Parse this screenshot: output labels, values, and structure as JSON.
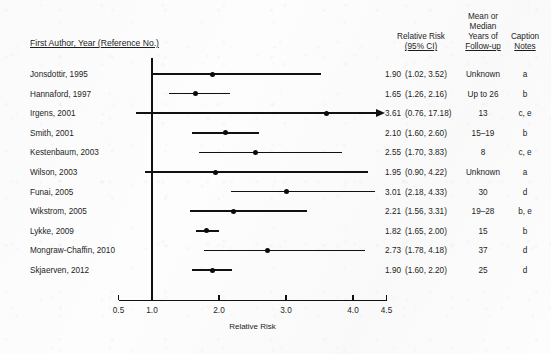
{
  "headers": {
    "author": "First Author, Year (Reference No.)",
    "relative_risk_l1": "Relative Risk",
    "relative_risk_l2": "(95% CI)",
    "years_l1": "Mean or",
    "years_l2": "Median",
    "years_l3": "Years of",
    "years_l4": "Follow-up",
    "caption_l1": "Caption",
    "caption_l2": "Notes"
  },
  "axis": {
    "title": "Relative Risk",
    "ticks": [
      "0.5",
      "1.0",
      "2.0",
      "3.0",
      "4.0",
      "4.5"
    ],
    "tick_values": [
      0.5,
      1.0,
      2.0,
      3.0,
      4.0,
      4.5
    ],
    "null_value": 1.0
  },
  "chart_data": {
    "type": "forest",
    "title": "",
    "xlabel": "Relative Risk",
    "ylabel": "",
    "xlim": [
      0.5,
      4.5
    ],
    "xticks": [
      0.5,
      1.0,
      2.0,
      3.0,
      4.0,
      4.5
    ],
    "reference_line": 1.0,
    "grid": false,
    "legend": "none",
    "columns": [
      "First Author, Year (Reference No.)",
      "Relative Risk (95% CI)",
      "Mean or Median Years of Follow-up",
      "Caption Notes"
    ],
    "rows": [
      {
        "study": "Jonsdottir, 1995",
        "rr": "1.90",
        "ci": "(1.02, 3.52)",
        "rr_value": 1.9,
        "ci_low": 1.02,
        "ci_high": 3.52,
        "years": "Unknown",
        "notes": "a",
        "truncated_right": false
      },
      {
        "study": "Hannaford, 1997",
        "rr": "1.65",
        "ci": "(1.26, 2.16)",
        "rr_value": 1.65,
        "ci_low": 1.26,
        "ci_high": 2.16,
        "years": "Up to 26",
        "notes": "b",
        "truncated_right": false
      },
      {
        "study": "Irgens, 2001",
        "rr": "3.61",
        "ci": "(0.76, 17.18)",
        "rr_value": 3.61,
        "ci_low": 0.76,
        "ci_high": 17.18,
        "years": "13",
        "notes": "c, e",
        "truncated_right": true
      },
      {
        "study": "Smith, 2001",
        "rr": "2.10",
        "ci": "(1.60, 2.60)",
        "rr_value": 2.1,
        "ci_low": 1.6,
        "ci_high": 2.6,
        "years": "15–19",
        "notes": "b",
        "truncated_right": false
      },
      {
        "study": "Kestenbaum, 2003",
        "rr": "2.55",
        "ci": "(1.70, 3.83)",
        "rr_value": 2.55,
        "ci_low": 1.7,
        "ci_high": 3.83,
        "years": "8",
        "notes": "c, e",
        "truncated_right": false
      },
      {
        "study": "Wilson, 2003",
        "rr": "1.95",
        "ci": "(0.90, 4.22)",
        "rr_value": 1.95,
        "ci_low": 0.9,
        "ci_high": 4.22,
        "years": "Unknown",
        "notes": "a",
        "truncated_right": false
      },
      {
        "study": "Funai, 2005",
        "rr": "3.01",
        "ci": "(2.18, 4.33)",
        "rr_value": 3.01,
        "ci_low": 2.18,
        "ci_high": 4.33,
        "years": "30",
        "notes": "d",
        "truncated_right": false
      },
      {
        "study": "Wikstrom, 2005",
        "rr": "2.21",
        "ci": "(1.56, 3.31)",
        "rr_value": 2.21,
        "ci_low": 1.56,
        "ci_high": 3.31,
        "years": "19–28",
        "notes": "b, e",
        "truncated_right": false
      },
      {
        "study": "Lykke, 2009",
        "rr": "1.82",
        "ci": "(1.65, 2.00)",
        "rr_value": 1.82,
        "ci_low": 1.65,
        "ci_high": 2.0,
        "years": "15",
        "notes": "b",
        "truncated_right": false
      },
      {
        "study": "Mongraw-Chaffin, 2010",
        "rr": "2.73",
        "ci": "(1.78, 4.18)",
        "rr_value": 2.73,
        "ci_low": 1.78,
        "ci_high": 4.18,
        "years": "37",
        "notes": "d",
        "truncated_right": false
      },
      {
        "study": "Skjaerven, 2012",
        "rr": "1.90",
        "ci": "(1.60, 2.20)",
        "rr_value": 1.9,
        "ci_low": 1.6,
        "ci_high": 2.2,
        "years": "25",
        "notes": "d",
        "truncated_right": false
      }
    ]
  },
  "colors": {
    "ink": "#111111",
    "paper": "#fdfdfd"
  }
}
